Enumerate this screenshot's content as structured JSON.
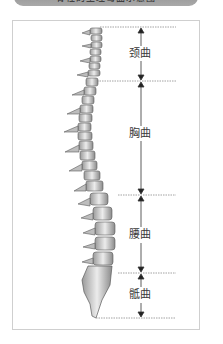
{
  "banner": {
    "text": "脊柱的生理弯曲示意图"
  },
  "diagram": {
    "regions": [
      {
        "label": "颈曲",
        "top": 27,
        "bottom": 81,
        "label_y": 48
      },
      {
        "label": "胸曲",
        "top": 81,
        "bottom": 195,
        "label_y": 128
      },
      {
        "label": "腰曲",
        "top": 195,
        "bottom": 273,
        "label_y": 229
      },
      {
        "label": "骶曲",
        "top": 273,
        "bottom": 318,
        "label_y": 289
      }
    ],
    "colors": {
      "line": "#8a8a8a",
      "arrow": "#222222",
      "bone_light": "#e6e6e6",
      "bone_dark": "#6e6e6e",
      "frame": "#cfcfcf"
    }
  }
}
